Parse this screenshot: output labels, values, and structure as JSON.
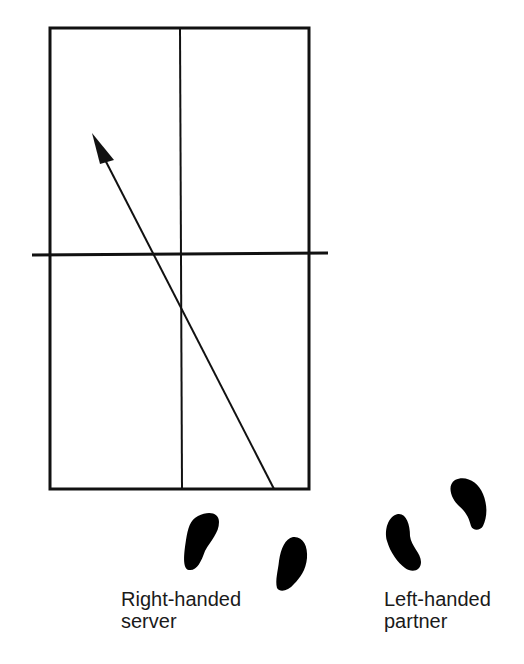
{
  "diagram": {
    "type": "badminton doubles serve diagram",
    "court": {
      "outline": {
        "x1": 50,
        "y1": 28,
        "x2": 309,
        "y2": 489
      },
      "center_line_x": 180,
      "net": {
        "y": 254,
        "x1": 32,
        "x2": 328
      },
      "line_color": "#111111"
    },
    "shot_arrow": {
      "from": [
        274,
        489
      ],
      "to": [
        92,
        133
      ],
      "color": "#111111"
    },
    "players": [
      {
        "name": "server",
        "label_line1": "Right-handed",
        "label_line2": "server"
      },
      {
        "name": "partner",
        "label_line1": "Left-handed",
        "label_line2": "partner"
      }
    ],
    "caption": ""
  }
}
